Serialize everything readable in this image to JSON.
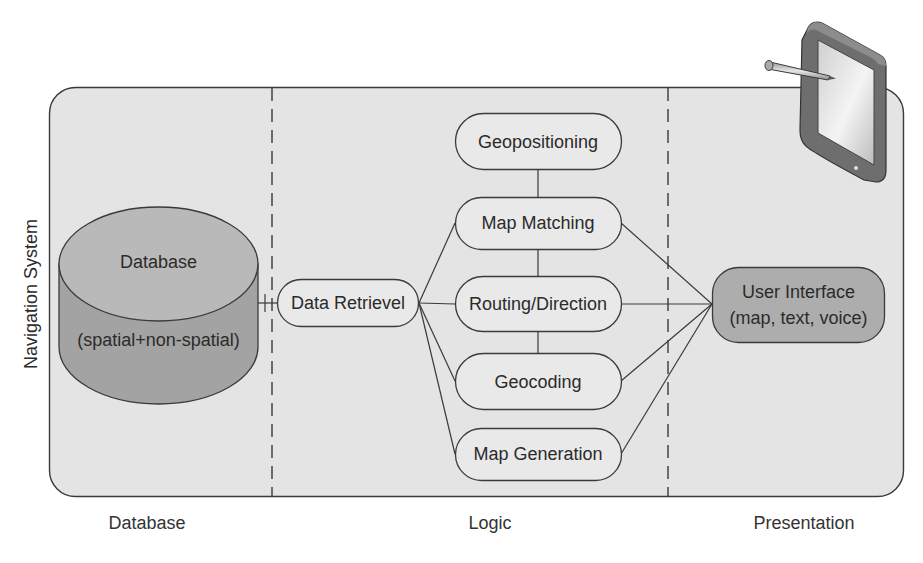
{
  "diagram": {
    "title": "Navigation System",
    "colors": {
      "panel_fill": "#e4e4e4",
      "panel_stroke": "#3a3a3a",
      "node_fill": "#e9e9e9",
      "cylinder_top": "#b9b9b9",
      "cylinder_side": "#a3a3a3",
      "ui_fill": "#adadad",
      "line": "#3a3a3a"
    },
    "tiers": [
      {
        "id": "database",
        "label": "Database"
      },
      {
        "id": "logic",
        "label": "Logic"
      },
      {
        "id": "presentation",
        "label": "Presentation"
      }
    ],
    "database_node": {
      "title": "Database",
      "subtitle": "(spatial+non-spatial)"
    },
    "data_retrieval_node": {
      "label": "Data Retrievel"
    },
    "logic_nodes": [
      {
        "id": "geopositioning",
        "label": "Geopositioning"
      },
      {
        "id": "map-matching",
        "label": "Map Matching"
      },
      {
        "id": "routing-direction",
        "label": "Routing/Direction"
      },
      {
        "id": "geocoding",
        "label": "Geocoding"
      },
      {
        "id": "map-generation",
        "label": "Map Generation"
      }
    ],
    "ui_node": {
      "line1": "User Interface",
      "line2": "(map, text, voice)"
    },
    "device_icon": "tablet-with-stylus-icon",
    "connections": [
      {
        "from": "database",
        "to": "data-retrieval"
      },
      {
        "from": "data-retrieval",
        "to": "map-matching"
      },
      {
        "from": "data-retrieval",
        "to": "routing-direction"
      },
      {
        "from": "data-retrieval",
        "to": "geocoding"
      },
      {
        "from": "data-retrieval",
        "to": "map-generation"
      },
      {
        "from": "geopositioning",
        "to": "map-matching"
      },
      {
        "from": "map-matching",
        "to": "routing-direction"
      },
      {
        "from": "routing-direction",
        "to": "geocoding"
      },
      {
        "from": "map-matching",
        "to": "user-interface"
      },
      {
        "from": "routing-direction",
        "to": "user-interface"
      },
      {
        "from": "geocoding",
        "to": "user-interface"
      },
      {
        "from": "map-generation",
        "to": "user-interface"
      }
    ]
  }
}
